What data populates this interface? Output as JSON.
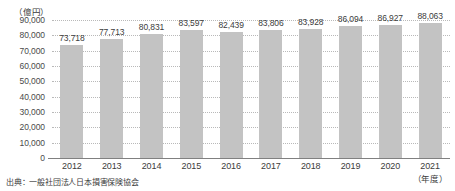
{
  "chart_data": {
    "type": "bar",
    "title": "",
    "subtitle": "",
    "unit_label": "（億円）",
    "xlabel": "（年度）",
    "ylabel": "",
    "categories": [
      "2012",
      "2013",
      "2014",
      "2015",
      "2016",
      "2017",
      "2018",
      "2019",
      "2020",
      "2021"
    ],
    "values": [
      73718,
      77713,
      80831,
      83597,
      82439,
      83806,
      83928,
      86094,
      86927,
      88063
    ],
    "value_labels": [
      "73,718",
      "77,713",
      "80,831",
      "83,597",
      "82,439",
      "83,806",
      "83,928",
      "86,094",
      "86,927",
      "88,063"
    ],
    "ylim": [
      0,
      90000
    ],
    "ytick_values": [
      0,
      10000,
      20000,
      30000,
      40000,
      50000,
      60000,
      70000,
      80000,
      90000
    ],
    "ytick_labels": [
      "0",
      "10,000",
      "20,000",
      "30,000",
      "40,000",
      "50,000",
      "60,000",
      "70,000",
      "80,000",
      "90,000"
    ],
    "grid": true,
    "grid_style": "dotted",
    "legend": false,
    "bar_color": "#c3c3c3",
    "axis_color": "#808080",
    "grid_color": "#b9b9b9",
    "text_color": "#3c3c3c"
  },
  "footer": {
    "source_note": "出典：一般社団法人日本損害保険協会"
  }
}
